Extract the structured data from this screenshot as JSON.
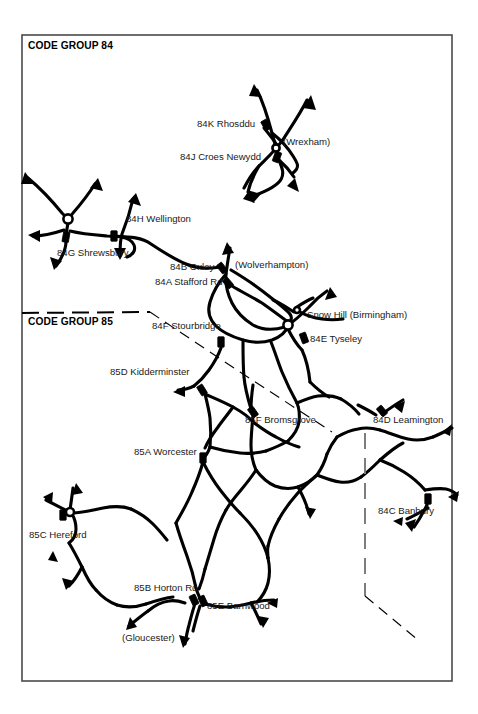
{
  "document": {
    "title": "Code Group 84 / 85 Motive Power Depot Map",
    "background_color": "#ffffff",
    "ink_color": "#000000",
    "frame_color": "#4a4a4a"
  },
  "frame": {
    "x": 22,
    "y": 35,
    "width": 430,
    "height": 646
  },
  "group_titles": [
    {
      "id": "grp84",
      "text": "CODE GROUP 84",
      "x": 28,
      "y": 49
    },
    {
      "id": "grp85",
      "text": "CODE GROUP 85",
      "x": 28,
      "y": 325
    }
  ],
  "labels": [
    {
      "id": "84K",
      "text": "84K Rhosddu",
      "x": 197,
      "y": 127,
      "anchor": "start"
    },
    {
      "id": "wrexham",
      "text": "(Wrexham)",
      "x": 283,
      "y": 145,
      "anchor": "start"
    },
    {
      "id": "84J",
      "text": "84J Croes Newydd",
      "x": 180,
      "y": 160,
      "anchor": "start"
    },
    {
      "id": "84H",
      "text": "84H Wellington",
      "x": 126,
      "y": 222,
      "anchor": "start"
    },
    {
      "id": "84G",
      "text": "84G Shrewsbury",
      "x": 57,
      "y": 256,
      "anchor": "start"
    },
    {
      "id": "84B",
      "text": "84B Oxley",
      "x": 170,
      "y": 270,
      "anchor": "start"
    },
    {
      "id": "wolverhampton",
      "text": "(Wolverhampton)",
      "x": 235,
      "y": 268,
      "anchor": "start"
    },
    {
      "id": "84A",
      "text": "84A Stafford Rd",
      "x": 155,
      "y": 285,
      "anchor": "start"
    },
    {
      "id": "snowhill",
      "text": "Snow Hill (Birmingham)",
      "x": 307,
      "y": 318,
      "anchor": "start"
    },
    {
      "id": "84F",
      "text": "84F Stourbridge",
      "x": 152,
      "y": 329,
      "anchor": "start"
    },
    {
      "id": "84E",
      "text": "84E Tyseley",
      "x": 310,
      "y": 342,
      "anchor": "start"
    },
    {
      "id": "85D",
      "text": "85D Kidderminster",
      "x": 110,
      "y": 375,
      "anchor": "start"
    },
    {
      "id": "85F",
      "text": "85F Bromsgrove",
      "x": 245,
      "y": 423,
      "anchor": "start"
    },
    {
      "id": "84D",
      "text": "84D Leamington",
      "x": 373,
      "y": 423,
      "anchor": "start"
    },
    {
      "id": "85A",
      "text": "85A Worcester",
      "x": 134,
      "y": 455,
      "anchor": "start"
    },
    {
      "id": "84C",
      "text": "84C Banbury",
      "x": 378,
      "y": 514,
      "anchor": "start"
    },
    {
      "id": "85C",
      "text": "85C Hereford",
      "x": 29,
      "y": 538,
      "anchor": "start"
    },
    {
      "id": "85B",
      "text": "85B Horton Rd",
      "x": 134,
      "y": 591,
      "anchor": "start"
    },
    {
      "id": "85E",
      "text": "85E Barnwood",
      "x": 207,
      "y": 609,
      "anchor": "start"
    },
    {
      "id": "gloucester",
      "text": "(Gloucester)",
      "x": 122,
      "y": 641,
      "anchor": "start"
    }
  ],
  "depots": [
    {
      "id": "84K",
      "name": "Rhosddu",
      "x": 266,
      "y": 125,
      "angle": -30
    },
    {
      "id": "84J",
      "name": "Croes Newydd",
      "x": 277,
      "y": 157,
      "angle": 20
    },
    {
      "id": "84G",
      "name": "Shrewsbury",
      "x": 66,
      "y": 237,
      "angle": 10
    },
    {
      "id": "84H",
      "name": "Wellington",
      "x": 114,
      "y": 236,
      "angle": 0
    },
    {
      "id": "84B",
      "name": "Oxley",
      "x": 222,
      "y": 268,
      "angle": -38
    },
    {
      "id": "84A",
      "name": "Stafford Rd",
      "x": 228,
      "y": 283,
      "angle": -40
    },
    {
      "id": "84F",
      "name": "Stourbridge",
      "x": 221,
      "y": 342,
      "angle": 0
    },
    {
      "id": "84E",
      "name": "Tyseley",
      "x": 304,
      "y": 338,
      "angle": -20
    },
    {
      "id": "85D",
      "name": "Kidderminster",
      "x": 202,
      "y": 390,
      "angle": -32
    },
    {
      "id": "85F",
      "name": "Bromsgrove",
      "x": 253,
      "y": 412,
      "angle": -35
    },
    {
      "id": "84D",
      "name": "Leamington",
      "x": 382,
      "y": 411,
      "angle": -40
    },
    {
      "id": "85A",
      "name": "Worcester",
      "x": 203,
      "y": 458,
      "angle": 0
    },
    {
      "id": "84C",
      "name": "Banbury",
      "x": 428,
      "y": 499,
      "angle": 0
    },
    {
      "id": "85C",
      "name": "Hereford",
      "x": 63,
      "y": 515,
      "angle": 0
    },
    {
      "id": "85B",
      "name": "Horton Rd",
      "x": 194,
      "y": 600,
      "angle": -25
    },
    {
      "id": "85E",
      "name": "Barnwood",
      "x": 203,
      "y": 601,
      "angle": -25
    }
  ],
  "junction_nodes": [
    {
      "id": "shrewsbury-node",
      "x": 68,
      "y": 219,
      "r": 4.6
    },
    {
      "id": "wrexham-node",
      "x": 276,
      "y": 148,
      "r": 3.6
    },
    {
      "id": "birmingham-node",
      "x": 288,
      "y": 325,
      "r": 4.6
    },
    {
      "id": "snowhill-node",
      "x": 297,
      "y": 310,
      "r": 3.0
    },
    {
      "id": "hereford-node",
      "x": 70,
      "y": 512,
      "r": 4.0
    }
  ],
  "boundary": {
    "name": "code-group-84-85-boundary",
    "style": "dashed",
    "segments": [
      {
        "id": "seg-horizontal",
        "points": "22,313 66,313 110,313 150,312"
      },
      {
        "id": "seg-diagonal",
        "points": "150,312 240,372 330,430"
      },
      {
        "id": "seg-vertical",
        "points": "365,433 365,596"
      },
      {
        "id": "seg-tail",
        "points": "365,596 418,640"
      }
    ]
  },
  "legend_notes": {
    "group84_count": 9,
    "group85_count": 6
  }
}
